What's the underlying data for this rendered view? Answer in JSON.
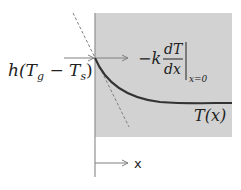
{
  "diagram": {
    "colors": {
      "solid_fill": "#d2d2d2",
      "curve": "#333333",
      "arrow": "#808080",
      "tangent": "#808080",
      "axis": "#909090",
      "text": "#222222"
    },
    "labels": {
      "convective_flux": {
        "h": "h(",
        "Tg": "T",
        "g_sub": "g",
        "minus": " − ",
        "Ts": "T",
        "s_sub": "s",
        "close": ")"
      },
      "conductive_flux": {
        "prefix": "−k",
        "numerator": "dT",
        "denominator": "dx",
        "eval": "x=0"
      },
      "temperature_profile": "T(x)",
      "x_axis": "x"
    }
  }
}
